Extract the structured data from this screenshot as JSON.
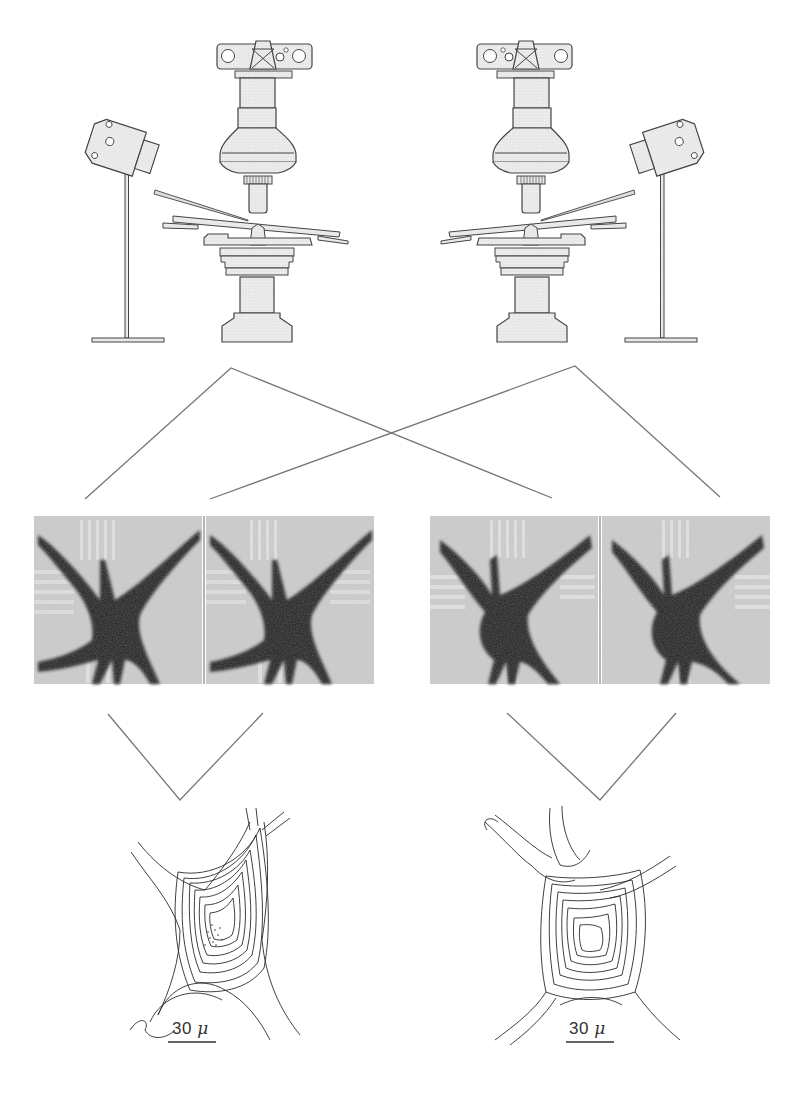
{
  "figure": {
    "colors": {
      "line": "#555555",
      "equipment_fill": "#e8e8e8",
      "equipment_stroke": "#444444",
      "cell_dark": "#1a1a1a",
      "background": "#ffffff"
    }
  },
  "panels": {
    "top": [
      {
        "id": "microscope-left",
        "orientation": "needle-from-left"
      },
      {
        "id": "microscope-right",
        "orientation": "needle-from-right"
      }
    ],
    "middle": [
      {
        "id": "stereo-pair-left",
        "images": 2
      },
      {
        "id": "stereo-pair-right",
        "images": 2
      }
    ],
    "bottom": [
      {
        "id": "contour-map-left",
        "scale_value": "30",
        "scale_unit": "μ"
      },
      {
        "id": "contour-map-right",
        "scale_value": "30",
        "scale_unit": "μ"
      }
    ]
  },
  "caption": {
    "text": ""
  }
}
